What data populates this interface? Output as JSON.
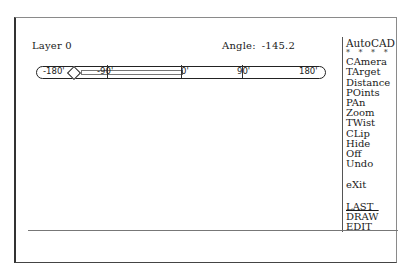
{
  "status": {
    "layer_label": "Layer",
    "layer_value": "0",
    "angle_label": "Angle:",
    "angle_value": "-145.2"
  },
  "slider": {
    "ticks": [
      {
        "label": "-180'",
        "value": -180
      },
      {
        "label": "-90'",
        "value": -90
      },
      {
        "label": "0'",
        "value": 0
      },
      {
        "label": "90'",
        "value": 90
      },
      {
        "label": "180'",
        "value": 180
      }
    ],
    "current_angle": -145.2,
    "marker_icon": "diamond-icon"
  },
  "menu": {
    "title": "AutoCAD",
    "separator": "* * * *",
    "items": [
      {
        "label": "CAmera"
      },
      {
        "label": "TArget"
      },
      {
        "label": "Distance"
      },
      {
        "label": "POints"
      },
      {
        "label": "PAn"
      },
      {
        "label": "Zoom"
      },
      {
        "label": "TWist"
      },
      {
        "label": "CLip"
      },
      {
        "label": "Hide"
      },
      {
        "label": "Off"
      },
      {
        "label": "Undo"
      }
    ],
    "exit": "eXit",
    "nav": [
      {
        "label": "LAST"
      },
      {
        "label": "DRAW"
      },
      {
        "label": "EDIT"
      }
    ]
  },
  "command_line": {
    "text": ""
  }
}
